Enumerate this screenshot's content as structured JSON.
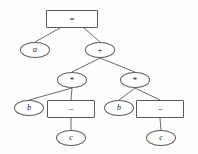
{
  "diagram": {
    "kind": "expression-tree",
    "title": "",
    "background_color": "#fdfdfd",
    "stroke_color": "#5a5a5a",
    "text_color": "#1a1a1a",
    "nodes": [
      {
        "id": "eq",
        "label": "=",
        "shape": "rect",
        "style": "op",
        "x": 46,
        "y": 10,
        "w": 52,
        "h": 18
      },
      {
        "id": "a",
        "label": "a",
        "shape": "ellipse",
        "style": "var",
        "x": 20,
        "y": 42,
        "w": 30,
        "h": 16
      },
      {
        "id": "plus",
        "label": "+",
        "shape": "ellipse",
        "style": "op",
        "x": 85,
        "y": 42,
        "w": 30,
        "h": 16
      },
      {
        "id": "mulL",
        "label": "*",
        "shape": "ellipse",
        "style": "op",
        "x": 57,
        "y": 72,
        "w": 30,
        "h": 16
      },
      {
        "id": "mulR",
        "label": "*",
        "shape": "ellipse",
        "style": "op",
        "x": 120,
        "y": 72,
        "w": 30,
        "h": 16
      },
      {
        "id": "bL",
        "label": "b",
        "shape": "ellipse",
        "style": "var",
        "x": 14,
        "y": 100,
        "w": 30,
        "h": 16
      },
      {
        "id": "minusL",
        "label": "−",
        "shape": "rect",
        "style": "op",
        "x": 47,
        "y": 100,
        "w": 48,
        "h": 18
      },
      {
        "id": "bR",
        "label": "b",
        "shape": "ellipse",
        "style": "var",
        "x": 104,
        "y": 100,
        "w": 30,
        "h": 16
      },
      {
        "id": "minusR",
        "label": "−",
        "shape": "rect",
        "style": "op",
        "x": 136,
        "y": 100,
        "w": 48,
        "h": 18
      },
      {
        "id": "cL",
        "label": "c",
        "shape": "ellipse",
        "style": "var",
        "x": 56,
        "y": 130,
        "w": 30,
        "h": 16
      },
      {
        "id": "cR",
        "label": "c",
        "shape": "ellipse",
        "style": "var",
        "x": 146,
        "y": 130,
        "w": 30,
        "h": 16
      }
    ],
    "edges": [
      {
        "from": "eq",
        "to": "a",
        "x1": 60,
        "y1": 28,
        "x2": 35,
        "y2": 42
      },
      {
        "from": "eq",
        "to": "plus",
        "x1": 84,
        "y1": 28,
        "x2": 100,
        "y2": 42
      },
      {
        "from": "plus",
        "to": "mulL",
        "x1": 100,
        "y1": 58,
        "x2": 72,
        "y2": 72
      },
      {
        "from": "plus",
        "to": "mulR",
        "x1": 100,
        "y1": 58,
        "x2": 135,
        "y2": 72
      },
      {
        "from": "mulL",
        "to": "bL",
        "x1": 72,
        "y1": 88,
        "x2": 29,
        "y2": 100
      },
      {
        "from": "mulL",
        "to": "minusL",
        "x1": 72,
        "y1": 88,
        "x2": 71,
        "y2": 100
      },
      {
        "from": "mulR",
        "to": "bR",
        "x1": 135,
        "y1": 88,
        "x2": 119,
        "y2": 100
      },
      {
        "from": "mulR",
        "to": "minusR",
        "x1": 135,
        "y1": 88,
        "x2": 160,
        "y2": 100
      },
      {
        "from": "minusL",
        "to": "cL",
        "x1": 71,
        "y1": 118,
        "x2": 71,
        "y2": 130
      },
      {
        "from": "minusR",
        "to": "cR",
        "x1": 160,
        "y1": 118,
        "x2": 161,
        "y2": 130
      }
    ]
  }
}
